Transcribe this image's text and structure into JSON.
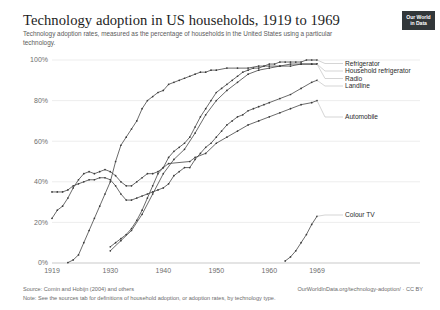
{
  "header": {
    "title": "Technology adoption in US households, 1919 to 1969",
    "subtitle": "Technology adoption rates, measured as the percentage of households in the United States using a particular technology.",
    "logo_line1": "Our World",
    "logo_line2": "in Data"
  },
  "footer": {
    "source": "Source: Comin and Hobijn (2004) and others",
    "url": "OurWorldInData.org/technology-adoption/ · CC BY",
    "note": "Note: See the sources tab for definitions of household adoption, or adoption rates, by technology type."
  },
  "colors": {
    "line": "#3a3a3a",
    "grid": "#e5e5e5",
    "axis": "#b3b3b3",
    "tick_text": "#6e6e6e",
    "title_text": "#1d1d1d",
    "subtitle_text": "#5b5b5b",
    "footer_text": "#6b6b6b",
    "logo_bg": "#32373a"
  },
  "chart_data": {
    "type": "line",
    "title": "Technology adoption in US households, 1919 to 1969",
    "subtitle": "Technology adoption rates, measured as the percentage of households in the United States using a particular technology.",
    "xlabel": "",
    "ylabel": "",
    "xlim": [
      1919,
      1969
    ],
    "ylim": [
      0,
      100
    ],
    "grid": true,
    "legend_position": "right-inline",
    "x_ticks": [
      1919,
      1930,
      1940,
      1950,
      1960,
      1969
    ],
    "x_tick_labels": [
      "1919",
      "1930",
      "1940",
      "1950",
      "1960",
      "1969"
    ],
    "y_ticks": [
      0,
      20,
      40,
      60,
      80,
      100
    ],
    "y_tick_labels": [
      "0%",
      "20%",
      "40%",
      "60%",
      "80%",
      "100%"
    ],
    "series": [
      {
        "name": "Refrigerator",
        "label": "Refrigerator",
        "x": [
          1930,
          1931,
          1932,
          1933,
          1934,
          1935,
          1936,
          1937,
          1938,
          1939,
          1940,
          1941,
          1942,
          1943,
          1944,
          1945,
          1946,
          1947,
          1948,
          1949,
          1950,
          1951,
          1952,
          1953,
          1954,
          1955,
          1956,
          1957,
          1958,
          1959,
          1960,
          1961,
          1962,
          1963,
          1964,
          1965,
          1966,
          1967,
          1968,
          1969
        ],
        "values": [
          8,
          10,
          12,
          14,
          17,
          21,
          26,
          32,
          38,
          44,
          47,
          52,
          55,
          57,
          59,
          62,
          67,
          72,
          76,
          80,
          84,
          86,
          88,
          90,
          92,
          94,
          95,
          96,
          96,
          97,
          98,
          98,
          99,
          99,
          99,
          99,
          99,
          100,
          100,
          100
        ]
      },
      {
        "name": "Household refrigerator",
        "label": "Household refrigerator",
        "x": [
          1930,
          1932,
          1934,
          1936,
          1938,
          1940,
          1942,
          1944,
          1946,
          1948,
          1950,
          1952,
          1954,
          1956,
          1958,
          1960,
          1962,
          1964,
          1966,
          1968,
          1969
        ],
        "values": [
          6,
          11,
          16,
          24,
          34,
          44,
          51,
          56,
          64,
          73,
          80,
          85,
          89,
          93,
          95,
          96,
          97,
          97,
          98,
          98,
          98
        ]
      },
      {
        "name": "Radio",
        "label": "Radio",
        "x": [
          1922,
          1923,
          1924,
          1925,
          1926,
          1927,
          1928,
          1929,
          1930,
          1931,
          1932,
          1933,
          1934,
          1935,
          1936,
          1937,
          1938,
          1939,
          1940,
          1941,
          1942,
          1943,
          1944,
          1945,
          1946,
          1947,
          1948,
          1949,
          1950,
          1952,
          1954,
          1956,
          1958,
          1960,
          1962,
          1964,
          1966,
          1968,
          1969
        ],
        "values": [
          0.2,
          1.5,
          4,
          10,
          16,
          22,
          28,
          34,
          40,
          50,
          58,
          62,
          66,
          70,
          76,
          80,
          82,
          84,
          85,
          88,
          89,
          90,
          91,
          92,
          93,
          94,
          94,
          95,
          95,
          96,
          96,
          96,
          97,
          97,
          97,
          98,
          98,
          98,
          98
        ]
      },
      {
        "name": "Landline",
        "label": "Landline",
        "x": [
          1919,
          1920,
          1921,
          1922,
          1923,
          1924,
          1925,
          1926,
          1927,
          1928,
          1929,
          1930,
          1931,
          1932,
          1933,
          1934,
          1935,
          1936,
          1937,
          1938,
          1939,
          1940,
          1941,
          1942,
          1943,
          1944,
          1945,
          1946,
          1947,
          1948,
          1949,
          1950,
          1951,
          1952,
          1953,
          1954,
          1955,
          1956,
          1957,
          1958,
          1959,
          1960,
          1962,
          1964,
          1966,
          1968,
          1969
        ],
        "values": [
          35,
          35,
          35,
          36,
          38,
          39,
          40,
          41,
          41,
          42,
          42,
          41,
          38,
          34,
          31,
          31,
          32,
          33,
          34,
          35,
          36,
          37,
          39,
          43,
          45,
          47,
          47,
          51,
          54,
          57,
          59,
          62,
          65,
          68,
          70,
          72,
          73,
          75,
          76,
          77,
          78,
          79,
          81,
          83,
          86,
          89,
          90
        ]
      },
      {
        "name": "Automobile",
        "label": "Automobile",
        "x": [
          1919,
          1920,
          1921,
          1922,
          1923,
          1924,
          1925,
          1926,
          1927,
          1928,
          1929,
          1930,
          1931,
          1932,
          1933,
          1934,
          1935,
          1936,
          1937,
          1938,
          1939,
          1940,
          1941,
          1945,
          1946,
          1948,
          1950,
          1952,
          1954,
          1956,
          1958,
          1960,
          1962,
          1964,
          1966,
          1968,
          1969
        ],
        "values": [
          22,
          26,
          28,
          32,
          37,
          41,
          44,
          45,
          44,
          45,
          46,
          45,
          43,
          40,
          38,
          38,
          40,
          42,
          44,
          44,
          45,
          47,
          49,
          50,
          52,
          54,
          59,
          62,
          65,
          68,
          70,
          72,
          74,
          76,
          78,
          79,
          80
        ]
      },
      {
        "name": "Colour TV",
        "label": "Colour TV",
        "x": [
          1963,
          1964,
          1965,
          1966,
          1967,
          1968,
          1969
        ],
        "values": [
          1,
          3,
          6,
          10,
          14,
          19,
          23
        ]
      }
    ],
    "annotations": [
      {
        "text": "Refrigerator",
        "x": 1969,
        "y": 100
      },
      {
        "text": "Household refrigerator",
        "x": 1969,
        "y": 98
      },
      {
        "text": "Radio",
        "x": 1969,
        "y": 98
      },
      {
        "text": "Landline",
        "x": 1969,
        "y": 90
      },
      {
        "text": "Automobile",
        "x": 1969,
        "y": 80
      },
      {
        "text": "Colour TV",
        "x": 1969,
        "y": 23
      }
    ]
  }
}
